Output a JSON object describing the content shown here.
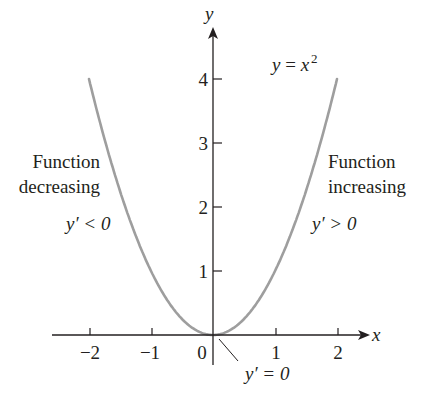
{
  "chart_data": {
    "type": "line",
    "title": "",
    "function": "y = x^2",
    "xlabel": "x",
    "ylabel": "y",
    "xlim": [
      -2.0,
      2.5
    ],
    "ylim": [
      0,
      4.8
    ],
    "x_ticks": [
      "−2",
      "−1",
      "0",
      "1",
      "2"
    ],
    "y_ticks": [
      "1",
      "2",
      "3",
      "4"
    ],
    "grid": false,
    "series": [
      {
        "name": "y = x^2",
        "color": "#9e9e9e",
        "x": [
          -2,
          -1.5,
          -1,
          -0.5,
          0,
          0.5,
          1,
          1.5,
          2
        ],
        "y": [
          4,
          2.25,
          1,
          0.25,
          0,
          0.25,
          1,
          2.25,
          4
        ]
      }
    ],
    "annotations": [
      {
        "text": "y = x²",
        "position": "upper right of y-axis"
      },
      {
        "text": "Function decreasing",
        "position": "left branch"
      },
      {
        "text": "y′ < 0",
        "position": "left branch"
      },
      {
        "text": "Function increasing",
        "position": "right branch"
      },
      {
        "text": "y′ > 0",
        "position": "right branch"
      },
      {
        "text": "y′ = 0",
        "position": "origin, with leader line"
      }
    ]
  },
  "labels": {
    "x_axis": "x",
    "y_axis": "y",
    "equation_lhs": "y",
    "equation_eq": " = ",
    "equation_base": "x",
    "equation_exp": "2",
    "left_line1": "Function",
    "left_line2": "decreasing",
    "left_deriv": "y′ < 0",
    "right_line1": "Function",
    "right_line2": "increasing",
    "right_deriv": "y′ > 0",
    "origin_deriv": "y′ = 0",
    "tick_xm2": "−2",
    "tick_xm1": "−1",
    "tick_x0": "0",
    "tick_x1": "1",
    "tick_x2": "2",
    "tick_y1": "1",
    "tick_y2": "2",
    "tick_y3": "3",
    "tick_y4": "4"
  },
  "colors": {
    "curve": "#9e9e9e",
    "axes": "#231f20",
    "text": "#231f20"
  }
}
